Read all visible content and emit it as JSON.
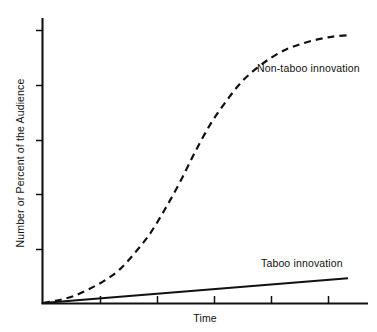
{
  "chart_data": {
    "type": "line",
    "title": "",
    "subtitle": "",
    "xlabel": "Time",
    "ylabel": "Number or Percent of the Audience",
    "xlim": [
      0,
      100
    ],
    "ylim": [
      0,
      100
    ],
    "grid": false,
    "legend_position": "inline-annotation",
    "x_tick_labels": [],
    "y_tick_labels": [],
    "x_tick_count": 5,
    "y_tick_count": 5,
    "annotations": [
      {
        "id": "non-taboo",
        "text": "Non-taboo innovation",
        "x": 67,
        "y": 80
      },
      {
        "id": "taboo",
        "text": "Taboo innovation",
        "x": 67,
        "y": 17
      }
    ],
    "series": [
      {
        "name": "Non-taboo innovation",
        "style": "dashed",
        "color": "#111111",
        "x": [
          0,
          5,
          10,
          15,
          20,
          25,
          30,
          35,
          40,
          45,
          50,
          55,
          60,
          65,
          70,
          75,
          80,
          85,
          90,
          95,
          100
        ],
        "values": [
          0,
          1,
          2.5,
          5,
          8,
          12,
          18,
          25,
          34,
          44,
          55,
          65,
          73,
          80,
          85,
          89,
          92,
          94,
          95.5,
          96.5,
          97
        ]
      },
      {
        "name": "Taboo innovation",
        "style": "solid",
        "color": "#111111",
        "x": [
          0,
          100
        ],
        "values": [
          0,
          9
        ]
      }
    ]
  },
  "labels": {
    "y_axis_title": "Number or Percent of the Audience",
    "x_axis_title": "Time",
    "series_non_taboo": "Non-taboo innovation",
    "series_taboo": "Taboo innovation"
  },
  "colors": {
    "ink": "#111111",
    "background": "#ffffff"
  }
}
